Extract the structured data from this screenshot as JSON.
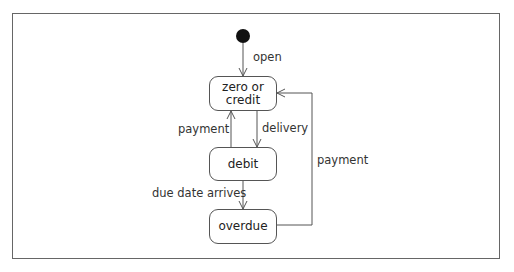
{
  "diagram": {
    "type": "state-machine",
    "initial": "initial-state",
    "states": [
      {
        "id": "zero_or_credit",
        "label": "zero or\ncredit",
        "line1": "zero or",
        "line2": "credit"
      },
      {
        "id": "debit",
        "label": "debit"
      },
      {
        "id": "overdue",
        "label": "overdue"
      }
    ],
    "transitions": [
      {
        "from": "initial",
        "to": "zero_or_credit",
        "label": "open"
      },
      {
        "from": "zero_or_credit",
        "to": "debit",
        "label": "delivery"
      },
      {
        "from": "debit",
        "to": "zero_or_credit",
        "label": "payment"
      },
      {
        "from": "debit",
        "to": "overdue",
        "label": "due date arrives"
      },
      {
        "from": "overdue",
        "to": "zero_or_credit",
        "label": "payment"
      }
    ]
  }
}
